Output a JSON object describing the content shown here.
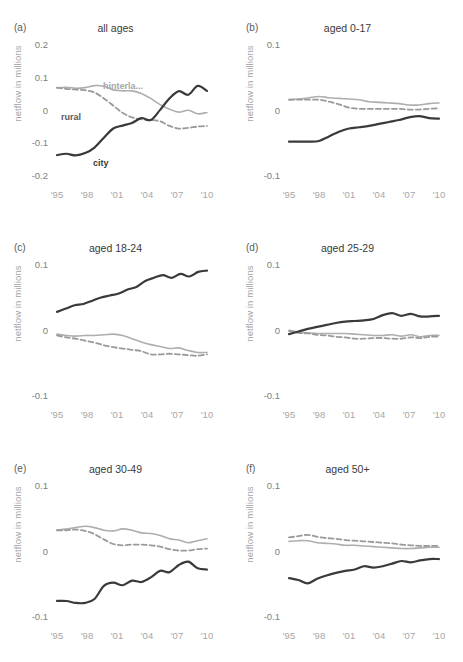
{
  "figure": {
    "width": 463,
    "height": 662,
    "background": "#ffffff",
    "caption": ""
  },
  "series_styles": {
    "city": {
      "color": "#3a3a3a",
      "dash": "none",
      "width": 2.2
    },
    "hinterland": {
      "color": "#aeaeae",
      "dash": "none",
      "width": 1.6
    },
    "rural": {
      "color": "#9a9a9a",
      "dash": "5,3",
      "width": 1.8
    }
  },
  "legend": {
    "hinterland_label": "hinterla...",
    "rural_label": "rural",
    "city_label": "city"
  },
  "axis": {
    "ylabel": "netflow in millions",
    "xticks": [
      "'95",
      "'98",
      "'01",
      "'04",
      "'07",
      "'10"
    ],
    "xtick_years": [
      1995,
      1998,
      2001,
      2004,
      2007,
      2010
    ],
    "yticks_a": [
      "0.2",
      "0.1",
      "0",
      "-0.1",
      "-0.2"
    ],
    "yticks_other": [
      "0.1",
      "0",
      "-0.1"
    ]
  },
  "chart_data": [
    {
      "type": "line",
      "panel": "a",
      "panel_label": "(a)",
      "title": "all ages",
      "xlabel": "",
      "ylabel": "netflow in millions",
      "ylim": [
        -0.2,
        0.2
      ],
      "xlim": [
        1995,
        2010
      ],
      "grid": false,
      "legend": "inline annotations",
      "x": [
        1995,
        1996,
        1997,
        1998,
        1999,
        2000,
        2001,
        2002,
        2003,
        2004,
        2005,
        2006,
        2007,
        2008,
        2009,
        2010
      ],
      "series": [
        {
          "name": "city",
          "values": [
            -0.133,
            -0.129,
            -0.134,
            -0.127,
            -0.11,
            -0.08,
            -0.052,
            -0.043,
            -0.035,
            -0.02,
            -0.026,
            0.005,
            0.04,
            0.062,
            0.051,
            0.078,
            0.063
          ]
        },
        {
          "name": "hinterland",
          "values": [
            0.072,
            0.074,
            0.071,
            0.073,
            0.079,
            0.077,
            0.066,
            0.063,
            0.063,
            0.055,
            0.04,
            0.021,
            0.007,
            -0.002,
            0.004,
            -0.007,
            -0.003
          ]
        },
        {
          "name": "rural",
          "values": [
            0.073,
            0.069,
            0.067,
            0.065,
            0.058,
            0.04,
            0.018,
            -0.004,
            -0.018,
            -0.024,
            -0.026,
            -0.03,
            -0.044,
            -0.052,
            -0.05,
            -0.046,
            -0.044
          ]
        }
      ]
    },
    {
      "type": "line",
      "panel": "b",
      "panel_label": "(b)",
      "title": "aged 0-17",
      "xlabel": "",
      "ylabel": "netflow in millions",
      "ylim": [
        -0.1,
        0.1
      ],
      "xlim": [
        1995,
        2010
      ],
      "grid": false,
      "x": [
        1995,
        1996,
        1997,
        1998,
        1999,
        2000,
        2001,
        2002,
        2003,
        2004,
        2005,
        2006,
        2007,
        2008,
        2009,
        2010
      ],
      "series": [
        {
          "name": "city",
          "values": [
            -0.046,
            -0.046,
            -0.046,
            -0.045,
            -0.038,
            -0.031,
            -0.026,
            -0.024,
            -0.022,
            -0.019,
            -0.016,
            -0.013,
            -0.009,
            -0.007,
            -0.01,
            -0.011
          ]
        },
        {
          "name": "hinterland",
          "values": [
            0.018,
            0.019,
            0.021,
            0.023,
            0.021,
            0.02,
            0.019,
            0.018,
            0.015,
            0.014,
            0.013,
            0.012,
            0.01,
            0.01,
            0.012,
            0.013
          ]
        },
        {
          "name": "rural",
          "values": [
            0.018,
            0.018,
            0.018,
            0.018,
            0.015,
            0.011,
            0.006,
            0.004,
            0.004,
            0.004,
            0.004,
            0.004,
            0.003,
            0.003,
            0.004,
            0.005
          ]
        }
      ]
    },
    {
      "type": "line",
      "panel": "c",
      "panel_label": "(c)",
      "title": "aged 18-24",
      "xlabel": "",
      "ylabel": "netflow in millions",
      "ylim": [
        -0.1,
        0.1
      ],
      "xlim": [
        1995,
        2010
      ],
      "grid": false,
      "x": [
        1995,
        1996,
        1997,
        1998,
        1999,
        2000,
        2001,
        2002,
        2003,
        2004,
        2005,
        2006,
        2007,
        2008,
        2009,
        2010
      ],
      "series": [
        {
          "name": "city",
          "values": [
            0.03,
            0.035,
            0.04,
            0.042,
            0.047,
            0.052,
            0.055,
            0.058,
            0.064,
            0.068,
            0.077,
            0.082,
            0.086,
            0.082,
            0.088,
            0.084,
            0.091,
            0.093
          ]
        },
        {
          "name": "hinterland",
          "values": [
            -0.004,
            -0.006,
            -0.007,
            -0.006,
            -0.006,
            -0.005,
            -0.004,
            -0.006,
            -0.011,
            -0.016,
            -0.02,
            -0.023,
            -0.026,
            -0.025,
            -0.029,
            -0.032,
            -0.032
          ]
        },
        {
          "name": "rural",
          "values": [
            -0.006,
            -0.009,
            -0.011,
            -0.014,
            -0.017,
            -0.021,
            -0.024,
            -0.026,
            -0.028,
            -0.03,
            -0.035,
            -0.035,
            -0.034,
            -0.035,
            -0.036,
            -0.037,
            -0.035
          ]
        }
      ]
    },
    {
      "type": "line",
      "panel": "d",
      "panel_label": "(d)",
      "title": "aged 25-29",
      "xlabel": "",
      "ylabel": "netflow in millions",
      "ylim": [
        -0.1,
        0.1
      ],
      "xlim": [
        1995,
        2010
      ],
      "grid": false,
      "x": [
        1995,
        1996,
        1997,
        1998,
        1999,
        2000,
        2001,
        2002,
        2003,
        2004,
        2005,
        2006,
        2007,
        2008,
        2009,
        2010
      ],
      "series": [
        {
          "name": "city",
          "values": [
            -0.004,
            0.0,
            0.004,
            0.007,
            0.01,
            0.013,
            0.015,
            0.016,
            0.017,
            0.019,
            0.025,
            0.028,
            0.024,
            0.027,
            0.023,
            0.023,
            0.024
          ]
        },
        {
          "name": "hinterland",
          "values": [
            0.002,
            -0.001,
            -0.002,
            -0.003,
            -0.003,
            -0.003,
            -0.003,
            -0.004,
            -0.005,
            -0.006,
            -0.006,
            -0.005,
            -0.007,
            -0.005,
            -0.008,
            -0.006,
            -0.006
          ]
        },
        {
          "name": "rural",
          "values": [
            0.001,
            -0.002,
            -0.003,
            -0.005,
            -0.006,
            -0.008,
            -0.009,
            -0.011,
            -0.011,
            -0.01,
            -0.01,
            -0.011,
            -0.011,
            -0.009,
            -0.01,
            -0.008,
            -0.008
          ]
        }
      ]
    },
    {
      "type": "line",
      "panel": "e",
      "panel_label": "(e)",
      "title": "aged 30-49",
      "xlabel": "",
      "ylabel": "netflow in millions",
      "ylim": [
        -0.1,
        0.1
      ],
      "xlim": [
        1995,
        2010
      ],
      "grid": false,
      "x": [
        1995,
        1996,
        1997,
        1998,
        1999,
        2000,
        2001,
        2002,
        2003,
        2004,
        2005,
        2006,
        2007,
        2008,
        2009,
        2010
      ],
      "series": [
        {
          "name": "city",
          "values": [
            -0.074,
            -0.074,
            -0.077,
            -0.077,
            -0.071,
            -0.051,
            -0.046,
            -0.05,
            -0.043,
            -0.045,
            -0.038,
            -0.028,
            -0.03,
            -0.019,
            -0.014,
            -0.024,
            -0.026
          ]
        },
        {
          "name": "hinterland",
          "values": [
            0.034,
            0.036,
            0.038,
            0.04,
            0.038,
            0.034,
            0.033,
            0.036,
            0.034,
            0.03,
            0.029,
            0.026,
            0.021,
            0.019,
            0.015,
            0.018,
            0.021
          ]
        },
        {
          "name": "rural",
          "values": [
            0.034,
            0.034,
            0.035,
            0.033,
            0.028,
            0.02,
            0.013,
            0.011,
            0.012,
            0.012,
            0.011,
            0.009,
            0.005,
            0.003,
            0.003,
            0.005,
            0.006
          ]
        }
      ]
    },
    {
      "type": "line",
      "panel": "f",
      "panel_label": "(f)",
      "title": "aged 50+",
      "xlabel": "",
      "ylabel": "netflow in millions",
      "ylim": [
        -0.1,
        0.1
      ],
      "xlim": [
        1995,
        2010
      ],
      "grid": false,
      "x": [
        1995,
        1996,
        1997,
        1998,
        1999,
        2000,
        2001,
        2002,
        2003,
        2004,
        2005,
        2006,
        2007,
        2008,
        2009,
        2010
      ],
      "series": [
        {
          "name": "city",
          "values": [
            -0.039,
            -0.042,
            -0.047,
            -0.04,
            -0.035,
            -0.031,
            -0.028,
            -0.026,
            -0.021,
            -0.023,
            -0.021,
            -0.017,
            -0.013,
            -0.015,
            -0.012,
            -0.01,
            -0.01
          ]
        },
        {
          "name": "hinterland",
          "values": [
            0.017,
            0.018,
            0.018,
            0.015,
            0.014,
            0.013,
            0.011,
            0.011,
            0.01,
            0.009,
            0.008,
            0.007,
            0.006,
            0.006,
            0.007,
            0.008,
            0.008
          ]
        },
        {
          "name": "rural",
          "values": [
            0.023,
            0.025,
            0.027,
            0.024,
            0.022,
            0.021,
            0.019,
            0.018,
            0.017,
            0.016,
            0.015,
            0.014,
            0.012,
            0.011,
            0.01,
            0.01,
            0.01
          ]
        }
      ]
    }
  ]
}
